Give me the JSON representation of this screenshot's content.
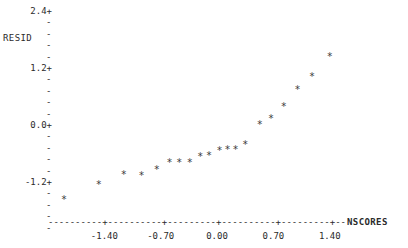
{
  "chart_data": {
    "type": "scatter",
    "title": "",
    "subtitle": "",
    "xlabel": "NSCORES",
    "ylabel": "RESID",
    "xlim": [
      -2.1,
      2.1
    ],
    "ylim": [
      -1.8,
      2.55
    ],
    "grid": false,
    "legend": null,
    "marker": "*",
    "x_ticks": [
      -1.4,
      -0.7,
      0.0,
      0.7,
      1.4
    ],
    "x_tick_labels": [
      "-1.40",
      "-0.70",
      "0.00",
      "0.70",
      "1.40"
    ],
    "y_ticks": [
      2.4,
      1.2,
      0.0,
      -1.2
    ],
    "y_tick_labels": [
      "2.4+",
      "1.2+",
      "0.0+",
      "-1.2+"
    ],
    "y_minor_tick": "-",
    "y_minor_per_interval": 5,
    "axis_style": "dashed-character-plot",
    "points": [
      {
        "x": -1.9,
        "y": -1.56
      },
      {
        "x": -1.47,
        "y": -1.24
      },
      {
        "x": -1.16,
        "y": -1.04
      },
      {
        "x": -0.94,
        "y": -1.05
      },
      {
        "x": -0.75,
        "y": -0.92
      },
      {
        "x": -0.59,
        "y": -0.77
      },
      {
        "x": -0.47,
        "y": -0.77
      },
      {
        "x": -0.34,
        "y": -0.77
      },
      {
        "x": -0.21,
        "y": -0.66
      },
      {
        "x": -0.1,
        "y": -0.64
      },
      {
        "x": 0.03,
        "y": -0.52
      },
      {
        "x": 0.13,
        "y": -0.51
      },
      {
        "x": 0.23,
        "y": -0.51
      },
      {
        "x": 0.35,
        "y": -0.41
      },
      {
        "x": 0.53,
        "y": 0.03
      },
      {
        "x": 0.67,
        "y": 0.15
      },
      {
        "x": 0.83,
        "y": 0.41
      },
      {
        "x": 1.0,
        "y": 0.75
      },
      {
        "x": 1.18,
        "y": 1.04
      },
      {
        "x": 1.4,
        "y": 1.45
      }
    ]
  },
  "axes": {
    "y_variable_label": "RESID",
    "x_variable_label": "NSCORES"
  }
}
